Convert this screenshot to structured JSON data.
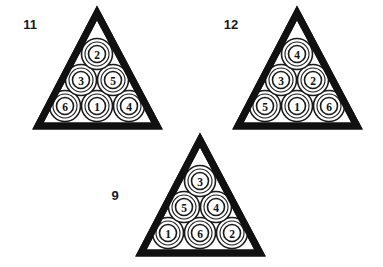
{
  "figure": {
    "background_color": "#ffffff",
    "ink_color": "#111111",
    "width": 383,
    "height": 267
  },
  "racks": [
    {
      "id": "rack-11",
      "label": "11",
      "label_x": 30,
      "label_y": 24,
      "apex_x": 97,
      "apex_y": 13,
      "left_x": 38,
      "right_x": 157,
      "base_y": 126,
      "rows": [
        {
          "name": "top-row",
          "balls": [
            {
              "value": "2",
              "cx": 97,
              "cy": 54
            }
          ]
        },
        {
          "name": "middle-row",
          "balls": [
            {
              "value": "3",
              "cx": 81,
              "cy": 80
            },
            {
              "value": "5",
              "cx": 113,
              "cy": 80
            }
          ]
        },
        {
          "name": "bottom-row",
          "balls": [
            {
              "value": "6",
              "cx": 65,
              "cy": 106
            },
            {
              "value": "1",
              "cx": 97,
              "cy": 106
            },
            {
              "value": "4",
              "cx": 129,
              "cy": 106
            }
          ]
        }
      ]
    },
    {
      "id": "rack-12",
      "label": "12",
      "label_x": 231,
      "label_y": 24,
      "apex_x": 297,
      "apex_y": 13,
      "left_x": 238,
      "right_x": 357,
      "base_y": 126,
      "rows": [
        {
          "name": "top-row",
          "balls": [
            {
              "value": "4",
              "cx": 297,
              "cy": 54
            }
          ]
        },
        {
          "name": "middle-row",
          "balls": [
            {
              "value": "3",
              "cx": 281,
              "cy": 80
            },
            {
              "value": "2",
              "cx": 313,
              "cy": 80
            }
          ]
        },
        {
          "name": "bottom-row",
          "balls": [
            {
              "value": "5",
              "cx": 265,
              "cy": 106
            },
            {
              "value": "1",
              "cx": 297,
              "cy": 106
            },
            {
              "value": "6",
              "cx": 329,
              "cy": 106
            }
          ]
        }
      ]
    },
    {
      "id": "rack-9",
      "label": "9",
      "label_x": 115,
      "label_y": 195,
      "apex_x": 200,
      "apex_y": 140,
      "left_x": 141,
      "right_x": 260,
      "base_y": 253,
      "rows": [
        {
          "name": "top-row",
          "balls": [
            {
              "value": "3",
              "cx": 200,
              "cy": 181
            }
          ]
        },
        {
          "name": "middle-row",
          "balls": [
            {
              "value": "5",
              "cx": 184,
              "cy": 207
            },
            {
              "value": "4",
              "cx": 216,
              "cy": 207
            }
          ]
        },
        {
          "name": "bottom-row",
          "balls": [
            {
              "value": "1",
              "cx": 168,
              "cy": 233
            },
            {
              "value": "6",
              "cx": 200,
              "cy": 233
            },
            {
              "value": "2",
              "cx": 232,
              "cy": 233
            }
          ]
        }
      ]
    }
  ],
  "geometry": {
    "ball_outer_radius": 15.5,
    "ball_mid_radius": 12,
    "ball_inner_radius": 8.5
  }
}
